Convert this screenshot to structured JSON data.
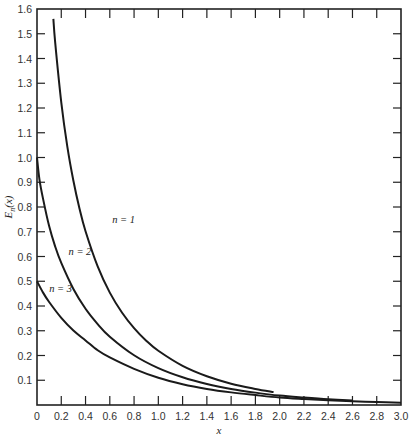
{
  "chart_data": {
    "type": "line",
    "title": "",
    "xlabel": "x",
    "ylabel": "E_n(x)",
    "xlim": [
      0,
      3.0
    ],
    "ylim": [
      0,
      1.6
    ],
    "grid": false,
    "legend": "inline labels",
    "x_ticks": [
      "0",
      "0.2",
      "0.4",
      "0.6",
      "0.8",
      "1.0",
      "1.2",
      "1.4",
      "1.6",
      "1.8",
      "2.0",
      "2.2",
      "2.4",
      "2.6",
      "2.8",
      "3.0"
    ],
    "y_ticks": [
      "0.1",
      "0.2",
      "0.3",
      "0.4",
      "0.5",
      "0.6",
      "0.7",
      "0.8",
      "0.9",
      "1.0",
      "1.1",
      "1.2",
      "1.3",
      "1.4",
      "1.5",
      "1.6"
    ],
    "series": [
      {
        "name": "n = 1",
        "label_pos": {
          "x": 0.62,
          "y": 0.735
        },
        "x": [
          0.135,
          0.15,
          0.2,
          0.25,
          0.3,
          0.35,
          0.4,
          0.5,
          0.6,
          0.7,
          0.8,
          0.9,
          1.0,
          1.2,
          1.4,
          1.6,
          1.8,
          1.95
        ],
        "values": [
          1.56,
          1.464,
          1.223,
          1.044,
          0.906,
          0.794,
          0.702,
          0.56,
          0.454,
          0.374,
          0.311,
          0.26,
          0.219,
          0.158,
          0.116,
          0.086,
          0.065,
          0.052
        ]
      },
      {
        "name": "n = 2",
        "label_pos": {
          "x": 0.26,
          "y": 0.605
        },
        "x": [
          0.0,
          0.02,
          0.05,
          0.1,
          0.15,
          0.2,
          0.3,
          0.4,
          0.5,
          0.6,
          0.8,
          1.0,
          1.2,
          1.4,
          1.6,
          1.8,
          2.0,
          2.2,
          2.4,
          2.6
        ],
        "values": [
          1.0,
          0.912,
          0.833,
          0.723,
          0.64,
          0.574,
          0.469,
          0.389,
          0.327,
          0.276,
          0.201,
          0.149,
          0.112,
          0.085,
          0.065,
          0.05,
          0.038,
          0.03,
          0.023,
          0.018
        ]
      },
      {
        "name": "n = 3",
        "label_pos": {
          "x": 0.1,
          "y": 0.455
        },
        "x": [
          0.0,
          0.05,
          0.1,
          0.2,
          0.3,
          0.4,
          0.5,
          0.6,
          0.8,
          1.0,
          1.2,
          1.4,
          1.6,
          1.8,
          2.0,
          2.2,
          2.4,
          2.6,
          2.8,
          3.0
        ],
        "values": [
          0.5,
          0.454,
          0.416,
          0.352,
          0.301,
          0.261,
          0.221,
          0.192,
          0.146,
          0.11,
          0.084,
          0.065,
          0.051,
          0.04,
          0.03,
          0.024,
          0.019,
          0.015,
          0.012,
          0.009
        ]
      }
    ]
  },
  "plot_area": {
    "left": 37,
    "top": 9,
    "right": 401,
    "bottom": 405
  }
}
